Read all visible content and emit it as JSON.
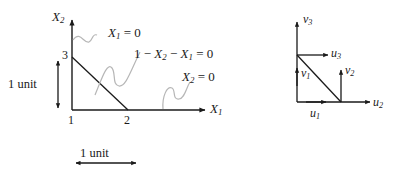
{
  "figure": {
    "background_color": "#ffffff",
    "line_color": "#1a1a1a",
    "leader_color": "#b0b0b0"
  },
  "left_diagram": {
    "axis_y_label": "X",
    "axis_y_sub": "2",
    "axis_x_label": "X",
    "axis_x_sub": "1",
    "ticks": {
      "y": [
        "3"
      ],
      "x": [
        "1",
        "2"
      ]
    },
    "equations": [
      {
        "text": "X",
        "sub": "1",
        "rest": " = 0"
      },
      {
        "text": "1 − X",
        "sub": "2",
        "rest": " − X",
        "sub2": "1",
        "rest2": " = 0"
      },
      {
        "text": "X",
        "sub": "2",
        "rest": " = 0"
      }
    ],
    "equation_1_plain": "X₁ = 0",
    "equation_2_plain": "1 − X₂ − X₁ = 0",
    "equation_3_plain": "X₂ = 0",
    "scale_vertical_label": "1 unit",
    "scale_horizontal_label": "1 unit"
  },
  "right_diagram": {
    "vectors": [
      {
        "name": "v",
        "sub": "3"
      },
      {
        "name": "u",
        "sub": "3"
      },
      {
        "name": "v",
        "sub": "1"
      },
      {
        "name": "v",
        "sub": "2"
      },
      {
        "name": "u",
        "sub": "1"
      },
      {
        "name": "u",
        "sub": "2"
      }
    ],
    "labels_plain": [
      "v₃",
      "u₃",
      "v₁",
      "v₂",
      "u₁",
      "u₂"
    ]
  }
}
